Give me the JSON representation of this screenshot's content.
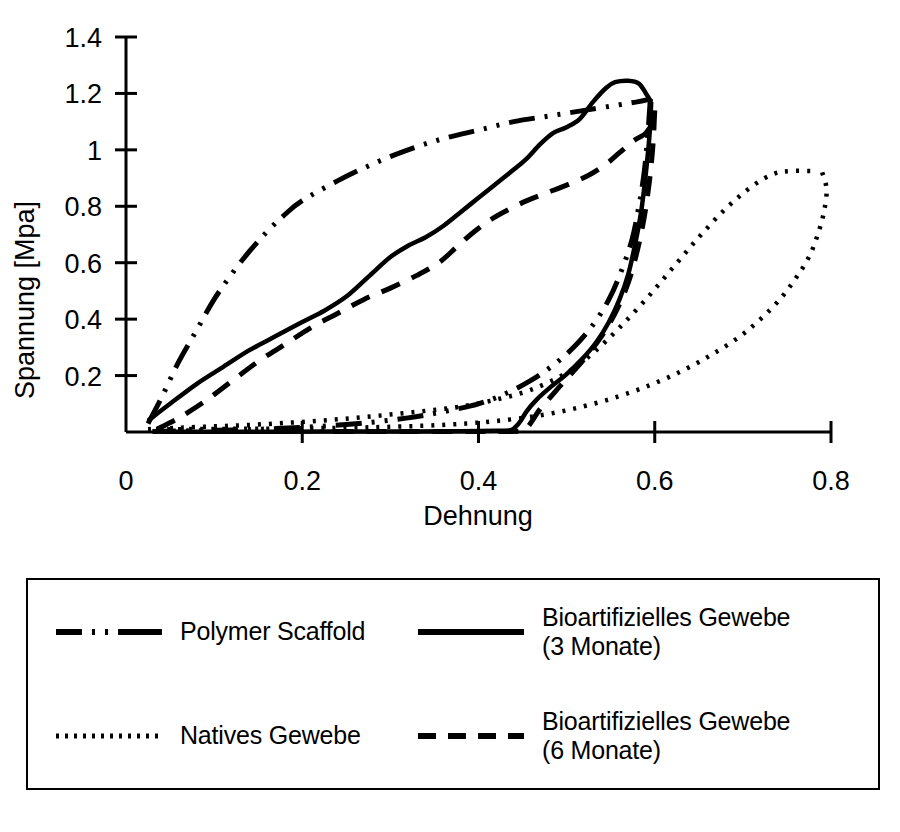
{
  "chart_data": {
    "type": "line",
    "title": "",
    "xlabel": "Dehnung",
    "ylabel": "Spannung [Mpa]",
    "xlim": [
      0,
      0.8
    ],
    "ylim": [
      0,
      1.4
    ],
    "xticks": [
      "0",
      "0.2",
      "0.4",
      "0.6",
      "0.8"
    ],
    "xtick_values": [
      0,
      0.2,
      0.4,
      0.6,
      0.8
    ],
    "yticks": [
      "0.2",
      "0.4",
      "0.6",
      "0.8",
      "1",
      "1.2",
      "1.4"
    ],
    "ytick_values": [
      0.2,
      0.4,
      0.6,
      0.8,
      1.0,
      1.2,
      1.4
    ],
    "grid": false,
    "legend_position": "below-plot",
    "series": [
      {
        "name": "Polymer Scaffold",
        "style": "dash-dot-dot",
        "loading": [
          [
            0.025,
            0.03
          ],
          [
            0.04,
            0.12
          ],
          [
            0.06,
            0.25
          ],
          [
            0.08,
            0.36
          ],
          [
            0.1,
            0.47
          ],
          [
            0.12,
            0.56
          ],
          [
            0.14,
            0.64
          ],
          [
            0.16,
            0.71
          ],
          [
            0.18,
            0.77
          ],
          [
            0.2,
            0.82
          ],
          [
            0.24,
            0.89
          ],
          [
            0.28,
            0.95
          ],
          [
            0.32,
            1.0
          ],
          [
            0.36,
            1.04
          ],
          [
            0.4,
            1.07
          ],
          [
            0.44,
            1.1
          ],
          [
            0.48,
            1.12
          ],
          [
            0.52,
            1.14
          ],
          [
            0.56,
            1.16
          ],
          [
            0.58,
            1.17
          ],
          [
            0.595,
            1.18
          ]
        ],
        "unloading": [
          [
            0.595,
            1.18
          ],
          [
            0.592,
            1.05
          ],
          [
            0.588,
            0.92
          ],
          [
            0.582,
            0.8
          ],
          [
            0.574,
            0.68
          ],
          [
            0.562,
            0.57
          ],
          [
            0.548,
            0.47
          ],
          [
            0.53,
            0.38
          ],
          [
            0.508,
            0.3
          ],
          [
            0.484,
            0.235
          ],
          [
            0.458,
            0.18
          ],
          [
            0.43,
            0.135
          ],
          [
            0.4,
            0.1
          ],
          [
            0.36,
            0.072
          ],
          [
            0.32,
            0.05
          ],
          [
            0.27,
            0.032
          ],
          [
            0.22,
            0.02
          ],
          [
            0.17,
            0.012
          ],
          [
            0.12,
            0.007
          ],
          [
            0.07,
            0.004
          ],
          [
            0.03,
            0.002
          ]
        ]
      },
      {
        "name": "Natives Gewebe",
        "style": "dotted",
        "loading": [
          [
            0.025,
            0.01
          ],
          [
            0.06,
            0.015
          ],
          [
            0.1,
            0.02
          ],
          [
            0.14,
            0.025
          ],
          [
            0.18,
            0.032
          ],
          [
            0.22,
            0.04
          ],
          [
            0.26,
            0.05
          ],
          [
            0.3,
            0.062
          ],
          [
            0.34,
            0.075
          ],
          [
            0.38,
            0.09
          ],
          [
            0.42,
            0.115
          ],
          [
            0.46,
            0.15
          ],
          [
            0.5,
            0.21
          ],
          [
            0.53,
            0.28
          ],
          [
            0.56,
            0.37
          ],
          [
            0.59,
            0.47
          ],
          [
            0.62,
            0.58
          ],
          [
            0.65,
            0.69
          ],
          [
            0.68,
            0.79
          ],
          [
            0.71,
            0.87
          ],
          [
            0.735,
            0.915
          ],
          [
            0.755,
            0.925
          ],
          [
            0.78,
            0.925
          ]
        ],
        "unloading": [
          [
            0.79,
            0.92
          ],
          [
            0.795,
            0.86
          ],
          [
            0.792,
            0.78
          ],
          [
            0.785,
            0.7
          ],
          [
            0.775,
            0.62
          ],
          [
            0.76,
            0.545
          ],
          [
            0.742,
            0.47
          ],
          [
            0.72,
            0.4
          ],
          [
            0.695,
            0.335
          ],
          [
            0.665,
            0.275
          ],
          [
            0.632,
            0.218
          ],
          [
            0.596,
            0.168
          ],
          [
            0.558,
            0.125
          ],
          [
            0.518,
            0.09
          ],
          [
            0.476,
            0.062
          ],
          [
            0.432,
            0.043
          ],
          [
            0.386,
            0.03
          ],
          [
            0.336,
            0.022
          ],
          [
            0.282,
            0.017
          ],
          [
            0.226,
            0.014
          ],
          [
            0.168,
            0.012
          ],
          [
            0.11,
            0.011
          ],
          [
            0.055,
            0.01
          ],
          [
            0.025,
            0.01
          ]
        ]
      },
      {
        "name": "Bioartifizielles Gewebe (3 Monate)",
        "style": "solid",
        "loading": [
          [
            0.025,
            0.04
          ],
          [
            0.05,
            0.1
          ],
          [
            0.08,
            0.17
          ],
          [
            0.11,
            0.23
          ],
          [
            0.14,
            0.29
          ],
          [
            0.17,
            0.34
          ],
          [
            0.2,
            0.39
          ],
          [
            0.225,
            0.43
          ],
          [
            0.25,
            0.48
          ],
          [
            0.275,
            0.55
          ],
          [
            0.3,
            0.62
          ],
          [
            0.32,
            0.66
          ],
          [
            0.34,
            0.69
          ],
          [
            0.36,
            0.73
          ],
          [
            0.38,
            0.78
          ],
          [
            0.4,
            0.83
          ],
          [
            0.42,
            0.88
          ],
          [
            0.44,
            0.93
          ],
          [
            0.455,
            0.97
          ],
          [
            0.47,
            1.02
          ],
          [
            0.485,
            1.06
          ],
          [
            0.5,
            1.08
          ],
          [
            0.515,
            1.11
          ],
          [
            0.53,
            1.17
          ],
          [
            0.545,
            1.22
          ],
          [
            0.555,
            1.24
          ],
          [
            0.57,
            1.245
          ],
          [
            0.582,
            1.235
          ],
          [
            0.59,
            1.2
          ],
          [
            0.596,
            1.17
          ]
        ],
        "unloading": [
          [
            0.596,
            1.17
          ],
          [
            0.594,
            1.05
          ],
          [
            0.59,
            0.92
          ],
          [
            0.585,
            0.79
          ],
          [
            0.578,
            0.67
          ],
          [
            0.57,
            0.56
          ],
          [
            0.56,
            0.47
          ],
          [
            0.548,
            0.39
          ],
          [
            0.534,
            0.32
          ],
          [
            0.518,
            0.26
          ],
          [
            0.5,
            0.205
          ],
          [
            0.482,
            0.16
          ],
          [
            0.466,
            0.115
          ],
          [
            0.455,
            0.075
          ],
          [
            0.448,
            0.04
          ],
          [
            0.442,
            0.018
          ],
          [
            0.436,
            0.006
          ],
          [
            0.42,
            0.004
          ],
          [
            0.38,
            0.003
          ],
          [
            0.32,
            0.002
          ],
          [
            0.25,
            0.002
          ],
          [
            0.18,
            0.001
          ],
          [
            0.1,
            0.001
          ],
          [
            0.04,
            0.001
          ]
        ]
      },
      {
        "name": "Bioartifizielles Gewebe (6 Monate)",
        "style": "dashed",
        "loading": [
          [
            0.035,
            0.01
          ],
          [
            0.06,
            0.05
          ],
          [
            0.09,
            0.11
          ],
          [
            0.12,
            0.18
          ],
          [
            0.15,
            0.25
          ],
          [
            0.18,
            0.31
          ],
          [
            0.21,
            0.37
          ],
          [
            0.24,
            0.42
          ],
          [
            0.27,
            0.47
          ],
          [
            0.3,
            0.51
          ],
          [
            0.33,
            0.555
          ],
          [
            0.355,
            0.6
          ],
          [
            0.375,
            0.655
          ],
          [
            0.395,
            0.71
          ],
          [
            0.415,
            0.755
          ],
          [
            0.435,
            0.79
          ],
          [
            0.455,
            0.82
          ],
          [
            0.475,
            0.845
          ],
          [
            0.5,
            0.875
          ],
          [
            0.525,
            0.91
          ],
          [
            0.545,
            0.95
          ],
          [
            0.56,
            0.99
          ],
          [
            0.575,
            1.03
          ],
          [
            0.59,
            1.06
          ],
          [
            0.598,
            1.1
          ]
        ],
        "unloading": [
          [
            0.6,
            1.14
          ],
          [
            0.598,
            1.02
          ],
          [
            0.594,
            0.89
          ],
          [
            0.588,
            0.76
          ],
          [
            0.58,
            0.64
          ],
          [
            0.57,
            0.53
          ],
          [
            0.558,
            0.44
          ],
          [
            0.544,
            0.36
          ],
          [
            0.528,
            0.29
          ],
          [
            0.512,
            0.23
          ],
          [
            0.496,
            0.175
          ],
          [
            0.482,
            0.125
          ],
          [
            0.47,
            0.082
          ],
          [
            0.462,
            0.045
          ],
          [
            0.456,
            0.018
          ],
          [
            0.45,
            0.004
          ],
          [
            0.43,
            0.002
          ],
          [
            0.39,
            0.002
          ],
          [
            0.34,
            0.002
          ],
          [
            0.28,
            0.002
          ],
          [
            0.22,
            0.002
          ]
        ]
      }
    ]
  },
  "axes": {
    "y_title": "Spannung [Mpa]",
    "x_title": "Dehnung",
    "y_tick_labels": [
      "1.4",
      "1.2",
      "1",
      "0.8",
      "0.6",
      "0.4",
      "0.2"
    ],
    "x_tick_labels": [
      "0",
      "0.2",
      "0.4",
      "0.6",
      "0.8"
    ]
  },
  "legend": {
    "entries": [
      {
        "label": "Polymer Scaffold",
        "style": "dash-dot-dot"
      },
      {
        "label": "Bioartifizielles Gewebe\n(3 Monate)",
        "style": "solid"
      },
      {
        "label": "Natives Gewebe",
        "style": "dotted"
      },
      {
        "label": "Bioartifizielles Gewebe\n(6 Monate)",
        "style": "dashed"
      }
    ]
  },
  "colors": {
    "line": "#000000",
    "axis": "#000000",
    "background": "#ffffff"
  }
}
